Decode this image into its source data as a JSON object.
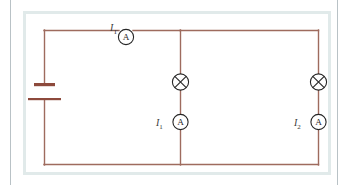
{
  "figure": {
    "wire_color": "#9e6b5e",
    "symbol_color": "#262626",
    "panel_border_color": "#e1eaea",
    "page_rule_color": "#b9c2c6"
  },
  "labels": {
    "total_current": {
      "symbol": "I",
      "subscript": "T",
      "text": "IT"
    },
    "branch1_current": {
      "symbol": "I",
      "subscript": "1",
      "text": "I1"
    },
    "branch2_current": {
      "symbol": "I",
      "subscript": "2",
      "text": "I2"
    }
  },
  "components": [
    {
      "name": "battery-cell",
      "type": "battery",
      "label": "",
      "position": "left-branch"
    },
    {
      "name": "ammeter-total",
      "type": "ammeter",
      "label": "A",
      "position": "top-wire",
      "current_label": "IT"
    },
    {
      "name": "lamp-1",
      "type": "lamp",
      "label": "",
      "position": "middle-branch-upper"
    },
    {
      "name": "ammeter-branch-1",
      "type": "ammeter",
      "label": "A",
      "position": "middle-branch-lower",
      "current_label": "I1"
    },
    {
      "name": "lamp-2",
      "type": "lamp",
      "label": "",
      "position": "right-branch-upper"
    },
    {
      "name": "ammeter-branch-2",
      "type": "ammeter",
      "label": "A",
      "position": "right-branch-lower",
      "current_label": "I2"
    }
  ],
  "meter_glyph": "A"
}
